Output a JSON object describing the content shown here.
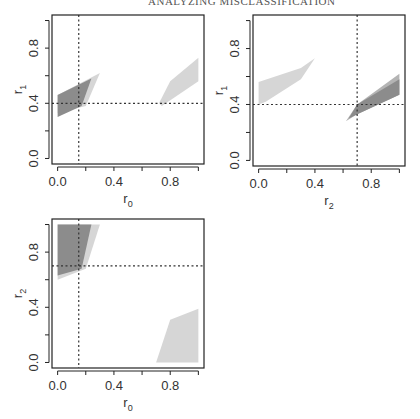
{
  "running_head": "ANALYZING MISCLASSIFICATION",
  "colors": {
    "dark_region": "#8c8c8c",
    "mid_region": "#b4b4b4",
    "light_region": "#d6d6d6",
    "frame": "#222222",
    "reference_line": "#333333"
  },
  "chart_data": [
    {
      "type": "area",
      "panel": "top-left",
      "xlabel": "r0",
      "xlabel_main": "r",
      "xlabel_sub": "0",
      "ylabel": "r1",
      "ylabel_main": "r",
      "ylabel_sub": "1",
      "xlim": [
        0,
        1
      ],
      "ylim": [
        0,
        1
      ],
      "xticks": [
        0.0,
        0.4,
        0.8
      ],
      "xtick_labels": [
        "0.0",
        "0.4",
        "0.8"
      ],
      "yticks": [
        0.0,
        0.4,
        0.8
      ],
      "ytick_labels": [
        "0.0",
        "0.4",
        "0.8"
      ],
      "minor_ticks": [
        0.2,
        0.6,
        1.0
      ],
      "reference_lines": {
        "vertical_x": 0.15,
        "horizontal_y": 0.4
      },
      "regions": [
        {
          "shade": "light",
          "polygon": [
            [
              0.0,
              0.33
            ],
            [
              0.0,
              0.46
            ],
            [
              0.3,
              0.62
            ],
            [
              0.2,
              0.38
            ]
          ]
        },
        {
          "shade": "dark",
          "polygon": [
            [
              0.0,
              0.3
            ],
            [
              0.0,
              0.46
            ],
            [
              0.24,
              0.58
            ],
            [
              0.17,
              0.38
            ]
          ]
        },
        {
          "shade": "light",
          "polygon": [
            [
              0.72,
              0.4
            ],
            [
              0.8,
              0.56
            ],
            [
              1.0,
              0.73
            ],
            [
              1.0,
              0.56
            ],
            [
              0.74,
              0.38
            ]
          ]
        }
      ],
      "grid": false
    },
    {
      "type": "area",
      "panel": "top-right",
      "xlabel": "r2",
      "xlabel_main": "r",
      "xlabel_sub": "2",
      "ylabel": "r1",
      "ylabel_main": "r",
      "ylabel_sub": "1",
      "xlim": [
        0,
        1
      ],
      "ylim": [
        0,
        1
      ],
      "xticks": [
        0.0,
        0.4,
        0.8
      ],
      "xtick_labels": [
        "0.0",
        "0.4",
        "0.8"
      ],
      "yticks": [
        0.0,
        0.4,
        0.8
      ],
      "ytick_labels": [
        "0.0",
        "0.4",
        "0.8"
      ],
      "minor_ticks": [
        0.2,
        0.6,
        1.0
      ],
      "reference_lines": {
        "vertical_x": 0.7,
        "horizontal_y": 0.4
      },
      "regions": [
        {
          "shade": "light",
          "polygon": [
            [
              0.0,
              0.4
            ],
            [
              0.0,
              0.56
            ],
            [
              0.3,
              0.66
            ],
            [
              0.4,
              0.73
            ],
            [
              0.3,
              0.58
            ],
            [
              0.05,
              0.42
            ]
          ]
        },
        {
          "shade": "mid",
          "polygon": [
            [
              0.62,
              0.28
            ],
            [
              0.7,
              0.4
            ],
            [
              1.0,
              0.62
            ],
            [
              1.0,
              0.47
            ],
            [
              0.7,
              0.33
            ]
          ]
        },
        {
          "shade": "dark",
          "polygon": [
            [
              0.64,
              0.3
            ],
            [
              0.7,
              0.4
            ],
            [
              1.0,
              0.58
            ],
            [
              1.0,
              0.47
            ],
            [
              0.72,
              0.34
            ]
          ]
        }
      ],
      "grid": false
    },
    {
      "type": "area",
      "panel": "bottom-left",
      "xlabel": "r0",
      "xlabel_main": "r",
      "xlabel_sub": "0",
      "ylabel": "r2",
      "ylabel_main": "r",
      "ylabel_sub": "2",
      "xlim": [
        0,
        1
      ],
      "ylim": [
        0,
        1
      ],
      "xticks": [
        0.0,
        0.4,
        0.8
      ],
      "xtick_labels": [
        "0.0",
        "0.4",
        "0.8"
      ],
      "yticks": [
        0.0,
        0.4,
        0.8
      ],
      "ytick_labels": [
        "0.0",
        "0.4",
        "0.8"
      ],
      "minor_ticks": [
        0.2,
        0.6,
        1.0
      ],
      "reference_lines": {
        "vertical_x": 0.15,
        "horizontal_y": 0.7
      },
      "regions": [
        {
          "shade": "light",
          "polygon": [
            [
              0.0,
              0.6
            ],
            [
              0.0,
              1.0
            ],
            [
              0.3,
              1.0
            ],
            [
              0.2,
              0.68
            ]
          ]
        },
        {
          "shade": "dark",
          "polygon": [
            [
              0.0,
              0.63
            ],
            [
              0.0,
              1.0
            ],
            [
              0.24,
              1.0
            ],
            [
              0.17,
              0.68
            ]
          ]
        },
        {
          "shade": "light",
          "polygon": [
            [
              0.7,
              0.0
            ],
            [
              0.8,
              0.31
            ],
            [
              1.0,
              0.39
            ],
            [
              1.0,
              0.0
            ]
          ]
        }
      ],
      "grid": false
    }
  ]
}
